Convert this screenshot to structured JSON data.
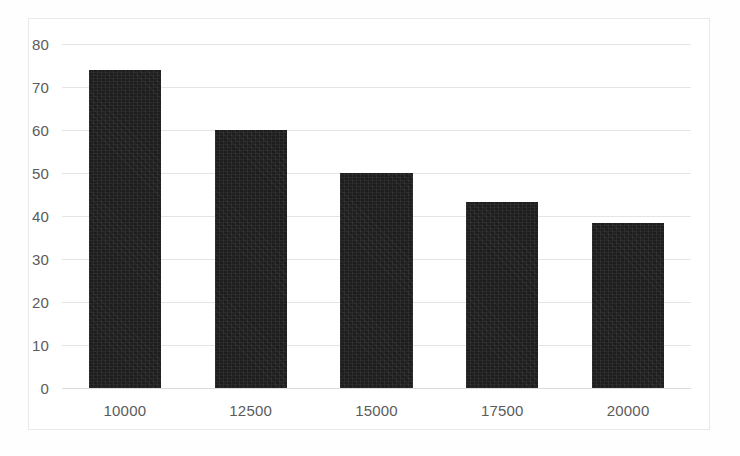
{
  "chart_data": {
    "type": "bar",
    "title": "",
    "subtitle": "",
    "xlabel": "",
    "ylabel": "",
    "categories": [
      "10000",
      "12500",
      "15000",
      "17500",
      "20000"
    ],
    "values": [
      74,
      60,
      50,
      43.3,
      38.3
    ],
    "series": [
      {
        "name": "",
        "values": [
          74,
          60,
          50,
          43.3,
          38.3
        ]
      }
    ],
    "ylim": [
      0,
      80
    ],
    "yticks": [
      0,
      10,
      20,
      30,
      40,
      50,
      60,
      70,
      80
    ],
    "ytick_labels": [
      "0",
      "10",
      "20",
      "30",
      "40",
      "50",
      "60",
      "70",
      "80"
    ],
    "grid": true,
    "grid_axis": "y",
    "legend": false,
    "legend_position": "none",
    "bar_color": "#1d1d1d",
    "gridline_color": "#e4e4e4",
    "axis_label_color": "#5b5b5b",
    "plot_background": "#ffffff",
    "frame_color": "#e9e9e9",
    "annotations": []
  }
}
